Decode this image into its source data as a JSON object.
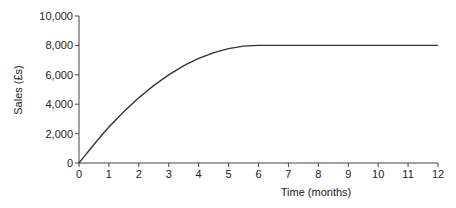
{
  "chart_data": {
    "type": "line",
    "title": "",
    "xlabel": "Time (months)",
    "ylabel": "Sales (£s)",
    "xlim": [
      0,
      12
    ],
    "ylim": [
      0,
      10000
    ],
    "x_ticks": [
      "0",
      "1",
      "2",
      "3",
      "4",
      "5",
      "6",
      "7",
      "8",
      "9",
      "10",
      "11",
      "12"
    ],
    "y_ticks": [
      "0",
      "2,000",
      "4,000",
      "6,000",
      "8,000",
      "10,000"
    ],
    "grid": false,
    "legend": null,
    "series": [
      {
        "name": "Sales",
        "x": [
          0,
          1,
          2,
          3,
          4,
          5,
          6,
          7,
          8,
          9,
          10,
          11,
          12
        ],
        "values": [
          0,
          2444,
          4444,
          6000,
          7111,
          7778,
          8000,
          8000,
          8000,
          8000,
          8000,
          8000,
          8000
        ]
      }
    ],
    "line_color": "#333333"
  }
}
